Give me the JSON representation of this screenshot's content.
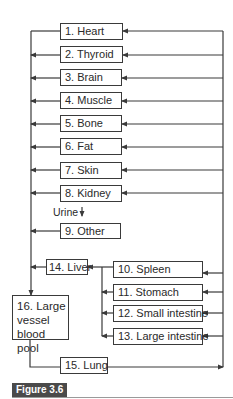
{
  "diagram": {
    "type": "compartment-flow",
    "organs": [
      {
        "id": 1,
        "label": "1. Heart"
      },
      {
        "id": 2,
        "label": "2. Thyroid"
      },
      {
        "id": 3,
        "label": "3. Brain"
      },
      {
        "id": 4,
        "label": "4. Muscle"
      },
      {
        "id": 5,
        "label": "5. Bone"
      },
      {
        "id": 6,
        "label": "6. Fat"
      },
      {
        "id": 7,
        "label": "7. Skin"
      },
      {
        "id": 8,
        "label": "8. Kidney"
      },
      {
        "id": 9,
        "label": "9. Other"
      },
      {
        "id": 10,
        "label": "10. Spleen"
      },
      {
        "id": 11,
        "label": "11. Stomach"
      },
      {
        "id": 12,
        "label": "12. Small intestine"
      },
      {
        "id": 13,
        "label": "13. Large intestine"
      },
      {
        "id": 14,
        "label": "14. Liver"
      },
      {
        "id": 15,
        "label": "15. Lung"
      },
      {
        "id": 16,
        "label": "16. Large vessel blood pool"
      }
    ],
    "urine_label": "Urine",
    "edges": [
      {
        "from": 15,
        "to": "arterial-bus"
      },
      {
        "from": "arterial-bus",
        "to": [
          1,
          2,
          3,
          4,
          5,
          6,
          7,
          8,
          10,
          11,
          12,
          13
        ]
      },
      {
        "from": [
          2,
          3,
          4,
          5,
          6,
          7,
          8,
          9
        ],
        "to": "venous-bus"
      },
      {
        "from": 8,
        "to": "urine"
      },
      {
        "from": [
          10,
          11,
          12,
          13
        ],
        "to": 14
      },
      {
        "from": 14,
        "to": "venous-bus"
      },
      {
        "from": "venous-bus",
        "to": 16
      },
      {
        "from": 16,
        "to": 15
      }
    ]
  },
  "figure": {
    "label": "Figure 3.6"
  },
  "colors": {
    "line": "#3a3a3a",
    "figure_label_bg": "#4a4a4a"
  }
}
